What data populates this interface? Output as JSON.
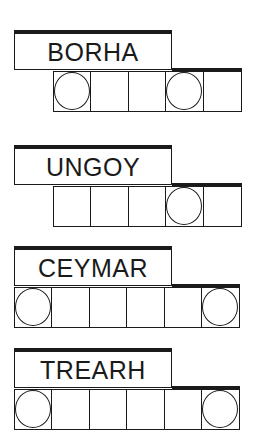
{
  "puzzles": [
    {
      "clue": "BORHA",
      "cell_count": 5,
      "circled": [
        true,
        false,
        false,
        true,
        false
      ]
    },
    {
      "clue": "UNGOY",
      "cell_count": 5,
      "circled": [
        false,
        false,
        false,
        true,
        false
      ]
    },
    {
      "clue": "CEYMAR",
      "cell_count": 6,
      "circled": [
        true,
        false,
        false,
        false,
        false,
        true
      ]
    },
    {
      "clue": "TREARH",
      "cell_count": 6,
      "circled": [
        true,
        false,
        false,
        false,
        false,
        true
      ]
    }
  ],
  "colors": {
    "ink": "#1a1a1a",
    "background": "#ffffff"
  }
}
